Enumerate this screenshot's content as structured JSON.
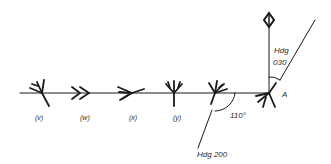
{
  "diagram": {
    "type": "navigation-heading-diagram",
    "colors": {
      "ink": "#1a1a1a",
      "background": "#ffffff"
    },
    "symbols": [
      {
        "id": "v",
        "label": "(v)",
        "x": 42
      },
      {
        "id": "w",
        "label": "(w)",
        "x": 82
      },
      {
        "id": "x",
        "label": "(x)",
        "x": 128
      },
      {
        "id": "y",
        "label": "(y)",
        "x": 174
      },
      {
        "id": "z",
        "label": "",
        "x": 215
      },
      {
        "id": "A",
        "label": "A",
        "x": 269
      }
    ],
    "point_label": "A",
    "angle_label": "110°",
    "heading_out_label": "Hdg 200",
    "heading_in_label_line1": "Hdg",
    "heading_in_label_line2": "030",
    "north_icon": "north-diamond-icon"
  }
}
